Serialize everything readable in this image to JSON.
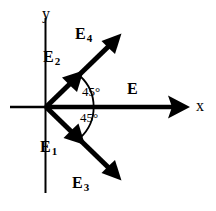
{
  "figure": {
    "background_color": "#ffffff",
    "stroke_color": "#000000",
    "axes": {
      "x_label": "x",
      "y_label": "y",
      "origin": {
        "x": 46,
        "y": 107
      }
    },
    "vectors": [
      {
        "id": "E",
        "label": "E",
        "subscript": "",
        "direction_deg": 0,
        "description": "resultant field along +x axis"
      },
      {
        "id": "E4",
        "label": "E",
        "subscript": "4",
        "direction_deg": 45,
        "description": "long vector up and to the right at 45 degrees"
      },
      {
        "id": "E2",
        "label": "E",
        "subscript": "2",
        "direction_deg": 45,
        "description": "short vector up and to the right at 45 degrees"
      },
      {
        "id": "E1",
        "label": "E",
        "subscript": "1",
        "direction_deg": -45,
        "description": "short vector down and to the right at 45 degrees"
      },
      {
        "id": "E3",
        "label": "E",
        "subscript": "3",
        "direction_deg": -45,
        "description": "long vector down and to the right at 45 degrees"
      }
    ],
    "angles": [
      {
        "id": "upper",
        "value": "45°",
        "between": "E4 and E"
      },
      {
        "id": "lower",
        "value": "45°",
        "between": "E and E3"
      }
    ]
  }
}
